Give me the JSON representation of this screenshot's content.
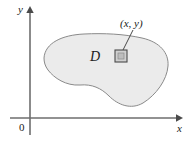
{
  "figure": {
    "caption_region_label": "D",
    "point_label": "(x, y)",
    "axis_x_label": "x",
    "axis_y_label": "y",
    "origin_label": "0",
    "colors": {
      "region_fill": "#ebebeb",
      "region_stroke": "#8a8a8a",
      "axis": "#6e6e6e",
      "text": "#1a1a1a",
      "marker_fill": "#d0d0d0",
      "marker_stroke": "#4a4a4a",
      "leader_line": "#4a4a4a"
    },
    "geometry": {
      "axis_origin": {
        "x": 30,
        "y": 118
      },
      "axis_x_end": {
        "x": 182,
        "y": 118
      },
      "axis_y_end": {
        "x": 30,
        "y": 8
      },
      "marker_square": {
        "x": 115,
        "y": 50,
        "size": 12
      },
      "leader_from": {
        "x": 133,
        "y": 30
      },
      "leader_to": {
        "x": 122,
        "y": 52
      },
      "region_path": "M 44 58 C 45 43 62 35 84 34 C 104 33 124 34 142 38 C 160 42 169 53 168 66 C 167 80 156 95 143 103 C 131 110 118 105 109 96 C 101 88 92 84 80 85 C 66 86 54 78 48 70 C 45 66 44 62 44 58 Z"
    }
  }
}
